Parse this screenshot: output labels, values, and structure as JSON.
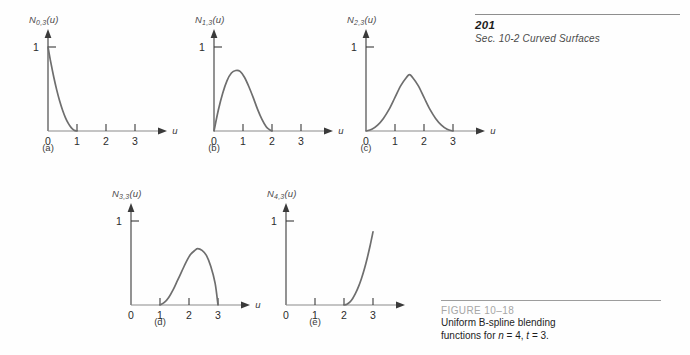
{
  "header": {
    "page_number": "201",
    "running_head": "Sec. 10-2   Curved Surfaces"
  },
  "figure": {
    "id": "FIGURE  10–18",
    "line1": "Uniform B-spline blending",
    "line2_prefix": "functions for ",
    "line2_n": "n",
    "line2_mid1": " = 4, ",
    "line2_t": "t",
    "line2_mid2": " = 3."
  },
  "axis": {
    "u_symbol": "u",
    "one": "1",
    "ticks": [
      "0",
      "1",
      "2",
      "3"
    ]
  },
  "chart_data": [
    {
      "type": "line",
      "id": "a",
      "title": "N_{0,3}(u)",
      "label_main": "N",
      "label_sub": "0,3",
      "label_arg": "(u)",
      "caption": "(a)",
      "xlabel": "u",
      "ylabel": "",
      "xlim": [
        0,
        3.45
      ],
      "ylim": [
        0,
        1.18
      ],
      "xticks": [
        0,
        1,
        2,
        3
      ],
      "ytick_label": "1",
      "support": [
        0,
        1
      ],
      "peak_x": 0.0,
      "peak_y": 1.0,
      "grid": false,
      "points": [
        [
          0.0,
          1.0
        ],
        [
          0.1,
          0.81
        ],
        [
          0.2,
          0.64
        ],
        [
          0.3,
          0.49
        ],
        [
          0.4,
          0.36
        ],
        [
          0.5,
          0.25
        ],
        [
          0.6,
          0.16
        ],
        [
          0.7,
          0.09
        ],
        [
          0.8,
          0.04
        ],
        [
          0.9,
          0.01
        ],
        [
          1.0,
          0.0
        ]
      ]
    },
    {
      "type": "line",
      "id": "b",
      "title": "N_{1,3}(u)",
      "label_main": "N",
      "label_sub": "1,3",
      "label_arg": "(u)",
      "caption": "(b)",
      "xlabel": "u",
      "ylabel": "",
      "xlim": [
        0,
        3.45
      ],
      "ylim": [
        0,
        1.18
      ],
      "xticks": [
        0,
        1,
        2,
        3
      ],
      "ytick_label": "1",
      "support": [
        0,
        2
      ],
      "peak_x": 0.8,
      "peak_y": 0.72,
      "grid": false,
      "points": [
        [
          0.0,
          0.0
        ],
        [
          0.15,
          0.25
        ],
        [
          0.3,
          0.45
        ],
        [
          0.45,
          0.6
        ],
        [
          0.6,
          0.69
        ],
        [
          0.75,
          0.72
        ],
        [
          0.9,
          0.71
        ],
        [
          1.05,
          0.64
        ],
        [
          1.2,
          0.53
        ],
        [
          1.35,
          0.4
        ],
        [
          1.5,
          0.26
        ],
        [
          1.65,
          0.14
        ],
        [
          1.8,
          0.05
        ],
        [
          1.9,
          0.02
        ],
        [
          2.0,
          0.0
        ]
      ]
    },
    {
      "type": "line",
      "id": "c",
      "title": "N_{2,3}(u)",
      "label_main": "N",
      "label_sub": "2,3",
      "label_arg": "(u)",
      "caption": "(c)",
      "xlabel": "u",
      "ylabel": "",
      "xlim": [
        0,
        3.45
      ],
      "ylim": [
        0,
        1.18
      ],
      "xticks": [
        0,
        1,
        2,
        3
      ],
      "ytick_label": "1",
      "support": [
        0,
        3
      ],
      "peak_x": 1.5,
      "peak_y": 0.67,
      "grid": false,
      "points": [
        [
          0.0,
          0.0
        ],
        [
          0.2,
          0.02
        ],
        [
          0.4,
          0.07
        ],
        [
          0.6,
          0.15
        ],
        [
          0.8,
          0.26
        ],
        [
          1.0,
          0.4
        ],
        [
          1.2,
          0.54
        ],
        [
          1.4,
          0.64
        ],
        [
          1.5,
          0.67
        ],
        [
          1.6,
          0.64
        ],
        [
          1.8,
          0.54
        ],
        [
          2.0,
          0.4
        ],
        [
          2.2,
          0.26
        ],
        [
          2.4,
          0.15
        ],
        [
          2.6,
          0.07
        ],
        [
          2.8,
          0.02
        ],
        [
          3.0,
          0.0
        ]
      ]
    },
    {
      "type": "line",
      "id": "d",
      "title": "N_{3,3}(u)",
      "label_main": "N",
      "label_sub": "3,3",
      "label_arg": "(u)",
      "caption": "(d)",
      "xlabel": "u",
      "ylabel": "",
      "xlim": [
        0,
        3.45
      ],
      "ylim": [
        0,
        1.18
      ],
      "xticks": [
        0,
        1,
        2,
        3
      ],
      "ytick_label": "1",
      "support": [
        1,
        3
      ],
      "peak_x": 2.3,
      "peak_y": 0.67,
      "grid": false,
      "points": [
        [
          1.0,
          0.0
        ],
        [
          1.15,
          0.03
        ],
        [
          1.3,
          0.09
        ],
        [
          1.45,
          0.18
        ],
        [
          1.6,
          0.29
        ],
        [
          1.75,
          0.4
        ],
        [
          1.9,
          0.51
        ],
        [
          2.05,
          0.6
        ],
        [
          2.2,
          0.65
        ],
        [
          2.3,
          0.67
        ],
        [
          2.45,
          0.65
        ],
        [
          2.6,
          0.59
        ],
        [
          2.75,
          0.46
        ],
        [
          2.9,
          0.26
        ],
        [
          3.0,
          0.0
        ]
      ]
    },
    {
      "type": "line",
      "id": "e",
      "title": "N_{4,3}(u)",
      "label_main": "N",
      "label_sub": "4,3",
      "label_arg": "(u)",
      "caption": "(e)",
      "xlabel": "u",
      "ylabel": "",
      "xlim": [
        0,
        3.45
      ],
      "ylim": [
        0,
        1.18
      ],
      "xticks": [
        0,
        1,
        2,
        3
      ],
      "ytick_label": "1",
      "support": [
        2,
        3
      ],
      "peak_x": 3.0,
      "peak_y": 0.87,
      "grid": false,
      "points": [
        [
          2.0,
          0.0
        ],
        [
          2.1,
          0.01
        ],
        [
          2.2,
          0.035
        ],
        [
          2.3,
          0.078
        ],
        [
          2.4,
          0.14
        ],
        [
          2.5,
          0.218
        ],
        [
          2.6,
          0.313
        ],
        [
          2.7,
          0.425
        ],
        [
          2.8,
          0.557
        ],
        [
          2.9,
          0.705
        ],
        [
          3.0,
          0.87
        ]
      ]
    }
  ]
}
